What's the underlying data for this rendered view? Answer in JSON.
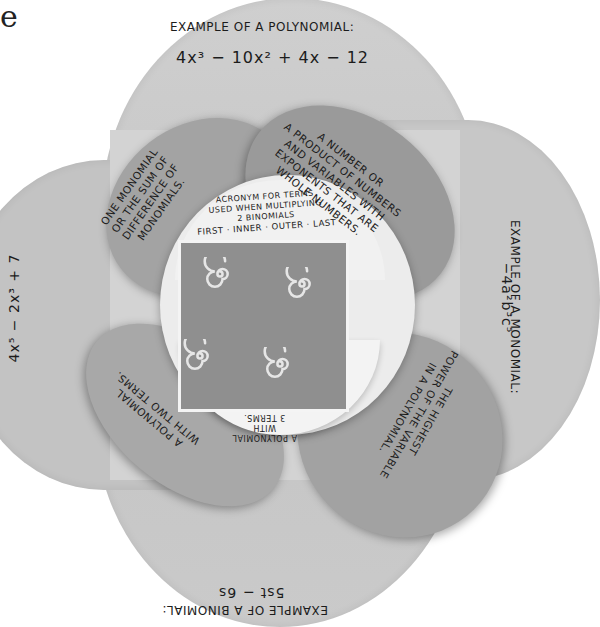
{
  "corner_letter": "e",
  "foldable": {
    "colors": {
      "outer_flap": "#c9c9c9",
      "petal": "#9e9e9e",
      "center_circle": "#ececec",
      "center_tile": "#8f8f8f",
      "ink": "#1c1c1c"
    },
    "top_flap": {
      "title": "EXAMPLE OF A POLYNOMIAL:",
      "expression": "4x³ − 10x² + 4x − 12"
    },
    "right_flap": {
      "title": "EXAMPLE OF A MONOMIAL:",
      "expression": "−4a²b³c⁵"
    },
    "bottom_flap": {
      "title": "EXAMPLE OF A BINOMIAL:",
      "expression": "5st − 6s"
    },
    "left_flap": {
      "expression": "4x⁵ − 2x³ + 7"
    },
    "petals": {
      "top_left": [
        "ONE MONOMIAL",
        "OR THE SUM OF",
        "DIFFERENCE OF",
        "MONOMIALS."
      ],
      "top_right": [
        "A NUMBER OR",
        "A PRODUCT OF NUMBERS",
        "AND VARIABLES WITH",
        "EXPONENTS THAT ARE",
        "WHOLE NUMBERS."
      ],
      "bottom_left": [
        "A POLYNOMIAL",
        "WITH TWO TERMS."
      ],
      "bottom_right": [
        "THE HIGHEST",
        "POWER OF THE VARIABLE",
        "IN A POLYNOMIAL."
      ]
    },
    "center": {
      "top_text": [
        "ACRONYM FOR TERMS",
        "USED WHEN MULTIPLYING",
        "2 BINOMIALS",
        "FIRST · INNER · OUTER · LAST"
      ],
      "bottom_text": [
        "A POLYNOMIAL",
        "WITH",
        "3 TERMS."
      ],
      "tile_decoration": "four white spirals"
    }
  }
}
